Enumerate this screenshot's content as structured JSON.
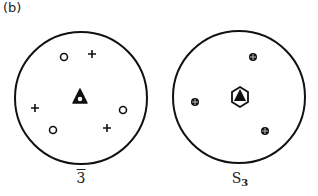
{
  "figure": {
    "panel_label": "(b)",
    "diagrams": [
      {
        "id": "rotoinversion-3bar",
        "symbol_label": "3",
        "symbol_overbar": true,
        "caption_text": "3̄",
        "center_symbol": "triangle-with-open-circle",
        "points": [
          {
            "marker": "open-circle",
            "x": 64,
            "y": 57
          },
          {
            "marker": "plus",
            "x": 92,
            "y": 54
          },
          {
            "marker": "plus",
            "x": 35,
            "y": 108
          },
          {
            "marker": "open-circle",
            "x": 123,
            "y": 110
          },
          {
            "marker": "open-circle",
            "x": 53,
            "y": 130
          },
          {
            "marker": "plus",
            "x": 107,
            "y": 128
          }
        ]
      },
      {
        "id": "rotoreflection-s3",
        "symbol_label": "S",
        "symbol_subscript": "3",
        "center_symbol": "hexagon-with-filled-triangle",
        "points": [
          {
            "marker": "circled-plus",
            "x": 253,
            "y": 57
          },
          {
            "marker": "circled-plus",
            "x": 195,
            "y": 102
          },
          {
            "marker": "circled-plus",
            "x": 265,
            "y": 131
          }
        ]
      }
    ],
    "colors": {
      "ink": "#111111",
      "background": "#ffffff"
    }
  }
}
